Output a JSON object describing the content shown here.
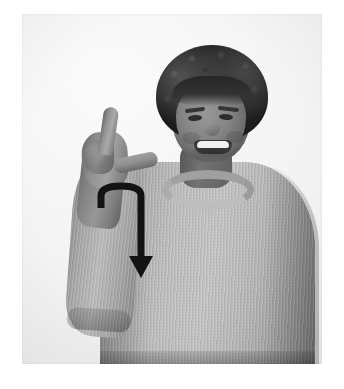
{
  "image": {
    "kind": "photograph",
    "color_mode": "grayscale",
    "width": 344,
    "height": 389,
    "caption": "Woman signing with an L handshape and a downward curved motion arrow",
    "background_color": "#f4f4f4",
    "page_background_color": "#ffffff"
  },
  "photo": {
    "frame": {
      "left": 22,
      "top": 14,
      "width": 300,
      "height": 350
    },
    "subject": {
      "description": "Smiling woman with short curly dark hair wearing a light gray ribbed knit sweater",
      "hair_color": "#2b2520",
      "skin_color": "#8e8277",
      "garment_color": "#b9b9b9",
      "expression": "smiling",
      "pose": "right hand raised beside face"
    },
    "handshape": {
      "name": "L-handshape",
      "description": "Index finger extended upward, thumb extended outward, remaining fingers folded"
    }
  },
  "annotation": {
    "type": "motion-arrow",
    "color": "#151515",
    "stroke_width": 7,
    "direction": "down",
    "shape": "hook-then-straight-down",
    "description": "Black arrow curving over from lower-left, hooking to the right, then travelling straight down with a solid triangular arrowhead",
    "start_point": {
      "x": 101,
      "y": 208
    },
    "hook_apex": {
      "x": 121,
      "y": 186
    },
    "end_point": {
      "x": 141,
      "y": 278
    },
    "arrowhead": {
      "width": 24,
      "height": 22
    }
  }
}
